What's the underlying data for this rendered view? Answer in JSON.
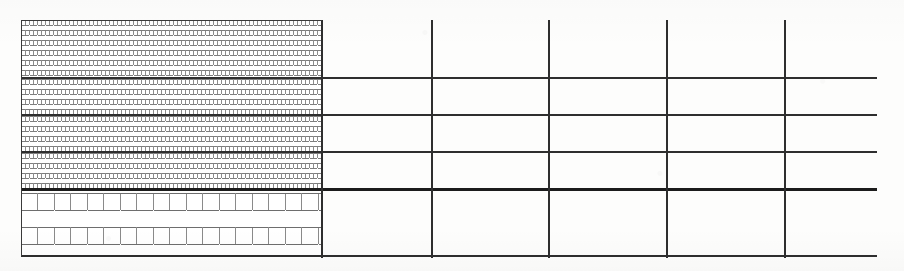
{
  "drawing": {
    "title": "Masonry wall elevation with coursing grid",
    "kind": "line-drawing",
    "background_color": "#fdfdfc",
    "line_color": "#2e2e2e",
    "heavy_joint_color": "#1c1c1c",
    "canvas": {
      "width": 904,
      "height": 271
    },
    "extent": {
      "left": 21,
      "top": 20,
      "right": 877,
      "bottom": 258
    },
    "texture_right_edge_x": 322,
    "regions": [
      {
        "name": "brick-course-band-1",
        "pattern": "small-brick-running-bond",
        "x": 21,
        "y": 20,
        "width": 301,
        "height": 58,
        "unit_width": 8,
        "unit_height": 5
      },
      {
        "name": "brick-course-band-2",
        "pattern": "small-brick-running-bond",
        "x": 21,
        "y": 79,
        "width": 301,
        "height": 36,
        "unit_width": 8,
        "unit_height": 5
      },
      {
        "name": "brick-course-band-3",
        "pattern": "small-brick-running-bond",
        "x": 21,
        "y": 116,
        "width": 301,
        "height": 36,
        "unit_width": 8,
        "unit_height": 5
      },
      {
        "name": "brick-course-band-4",
        "pattern": "small-brick-running-bond",
        "x": 21,
        "y": 153,
        "width": 301,
        "height": 36,
        "unit_width": 8,
        "unit_height": 5
      },
      {
        "name": "block-course-band",
        "pattern": "large-block-running-bond",
        "x": 21,
        "y": 193,
        "width": 301,
        "height": 65,
        "unit_width": 33,
        "unit_height": 17
      }
    ],
    "horizontal_lines": [
      {
        "name": "course-line-1",
        "y": 78,
        "x1": 21,
        "x2": 877,
        "thickness": 2
      },
      {
        "name": "course-line-2",
        "y": 115,
        "x1": 21,
        "x2": 877,
        "thickness": 2
      },
      {
        "name": "course-line-3",
        "y": 152,
        "x1": 21,
        "x2": 877,
        "thickness": 2
      },
      {
        "name": "course-line-4",
        "y": 189,
        "x1": 21,
        "x2": 877,
        "thickness": 3
      },
      {
        "name": "base-line",
        "y": 256,
        "x1": 21,
        "x2": 877,
        "thickness": 2
      }
    ],
    "vertical_lines": [
      {
        "name": "texture-boundary",
        "x": 321,
        "y1": 20,
        "y2": 258,
        "thickness": 2
      },
      {
        "name": "bay-line-1",
        "x": 431,
        "y1": 20,
        "y2": 258,
        "thickness": 2
      },
      {
        "name": "bay-line-2",
        "x": 548,
        "y1": 20,
        "y2": 258,
        "thickness": 2
      },
      {
        "name": "bay-line-3",
        "x": 666,
        "y1": 20,
        "y2": 258,
        "thickness": 2
      },
      {
        "name": "bay-line-4",
        "x": 784,
        "y1": 20,
        "y2": 258,
        "thickness": 2
      }
    ]
  }
}
